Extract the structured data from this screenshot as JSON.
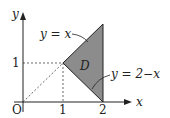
{
  "diagram": {
    "region_label": "D",
    "region_fill": "#8a8a8a",
    "line_color": "#222222",
    "axes": {
      "x_label": "x",
      "y_label": "y",
      "origin_label": "O",
      "x_ticks": [
        "1",
        "2"
      ],
      "y_ticks": [
        "1"
      ]
    },
    "curves": [
      {
        "label": "y = x"
      },
      {
        "label": "y = 2−x"
      }
    ],
    "vertices": [
      [
        1,
        1
      ],
      [
        2,
        2
      ],
      [
        2,
        0
      ]
    ]
  }
}
